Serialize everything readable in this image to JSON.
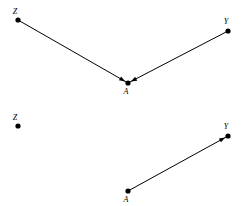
{
  "diagram": {
    "background_color": "#ffffff",
    "stroke_color": "#000000",
    "point_color": "#000000",
    "label_color": "#000000",
    "width": 245,
    "height": 206,
    "points": [
      {
        "id": "z-top",
        "label": "Z",
        "x": 18,
        "y": 20,
        "label_dx": -3,
        "label_dy": -6
      },
      {
        "id": "y-top",
        "label": "Y",
        "x": 228,
        "y": 31,
        "label_dx": -2,
        "label_dy": -7
      },
      {
        "id": "a-top",
        "label": "A",
        "x": 128,
        "y": 83,
        "label_dx": -2,
        "label_dy": 11
      },
      {
        "id": "z-isolated",
        "label": "Z",
        "x": 18,
        "y": 126,
        "label_dx": -3,
        "label_dy": -6
      },
      {
        "id": "a-bottom",
        "label": "A",
        "x": 128,
        "y": 191,
        "label_dx": -2,
        "label_dy": 11
      },
      {
        "id": "y-bottom",
        "label": "Y",
        "x": 228,
        "y": 136,
        "label_dx": -2,
        "label_dy": -7
      }
    ],
    "segments": [
      {
        "id": "segment-z-to-a",
        "from": "z-top",
        "to": "a-top",
        "arrow_at_end": true
      },
      {
        "id": "segment-y-to-a",
        "from": "y-top",
        "to": "a-top",
        "arrow_at_end": true
      },
      {
        "id": "segment-a-to-y",
        "from": "a-bottom",
        "to": "y-bottom",
        "arrow_at_end": true
      }
    ],
    "style": {
      "line_width": 1,
      "dot_radius": 2.6,
      "arrow_length": 6,
      "arrow_half_width": 2.2,
      "label_font_size": 8
    }
  }
}
